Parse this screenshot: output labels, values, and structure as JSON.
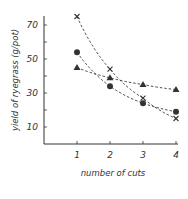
{
  "chart_data": {
    "type": "line",
    "title": "",
    "xlabel": "number of cuts",
    "ylabel": "yield of ryegrass (g/pot)",
    "x": [
      1,
      2,
      3,
      4
    ],
    "xticks": [
      "1",
      "2",
      "3",
      "4"
    ],
    "yticks": [
      "10",
      "30",
      "50",
      "70"
    ],
    "ylim": [
      0,
      78
    ],
    "xlim": [
      0,
      4.1
    ],
    "grid": false,
    "legend": "none",
    "line_style": "dashed",
    "series": [
      {
        "name": "cross",
        "marker": "x",
        "values": [
          75,
          44,
          27,
          15
        ]
      },
      {
        "name": "circle",
        "marker": "circle",
        "values": [
          54,
          34,
          24,
          19
        ]
      },
      {
        "name": "triangle",
        "marker": "triangle",
        "values": [
          45,
          39,
          35,
          32
        ]
      }
    ]
  },
  "colors": {
    "axis": "#333333",
    "series": "#333333",
    "background": "#ffffff"
  }
}
